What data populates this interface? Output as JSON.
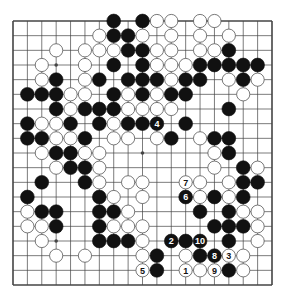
{
  "diagram": {
    "type": "go-board",
    "size": 19,
    "colors": {
      "board": "#ffffff",
      "line": "#444444",
      "black": "#111111",
      "white": "#ffffff",
      "white_outline": "#555555"
    },
    "hoshi": [
      [
        3,
        3
      ],
      [
        3,
        9
      ],
      [
        3,
        15
      ],
      [
        9,
        3
      ],
      [
        9,
        9
      ],
      [
        9,
        15
      ],
      [
        15,
        3
      ],
      [
        15,
        9
      ],
      [
        15,
        15
      ]
    ],
    "stones": {
      "black": [
        [
          0,
          7
        ],
        [
          0,
          9
        ],
        [
          1,
          7
        ],
        [
          1,
          8
        ],
        [
          2,
          8
        ],
        [
          2,
          9
        ],
        [
          2,
          15
        ],
        [
          3,
          7
        ],
        [
          3,
          9
        ],
        [
          3,
          13
        ],
        [
          3,
          14
        ],
        [
          3,
          15
        ],
        [
          3,
          16
        ],
        [
          3,
          17
        ],
        [
          4,
          3
        ],
        [
          4,
          6
        ],
        [
          4,
          8
        ],
        [
          4,
          9
        ],
        [
          4,
          10
        ],
        [
          4,
          12
        ],
        [
          4,
          13
        ],
        [
          4,
          16
        ],
        [
          5,
          1
        ],
        [
          5,
          2
        ],
        [
          5,
          3
        ],
        [
          5,
          7
        ],
        [
          5,
          9
        ],
        [
          5,
          11
        ],
        [
          5,
          12
        ],
        [
          6,
          3
        ],
        [
          6,
          5
        ],
        [
          6,
          6
        ],
        [
          6,
          7
        ],
        [
          6,
          15
        ],
        [
          7,
          1
        ],
        [
          7,
          4
        ],
        [
          7,
          6
        ],
        [
          7,
          8
        ],
        [
          7,
          9
        ],
        [
          7,
          12
        ],
        [
          8,
          1
        ],
        [
          8,
          2
        ],
        [
          8,
          5
        ],
        [
          8,
          11
        ],
        [
          8,
          14
        ],
        [
          8,
          15
        ],
        [
          9,
          3
        ],
        [
          9,
          4
        ],
        [
          9,
          15
        ],
        [
          10,
          4
        ],
        [
          10,
          5
        ],
        [
          10,
          16
        ],
        [
          11,
          2
        ],
        [
          11,
          5
        ],
        [
          11,
          16
        ],
        [
          11,
          17
        ],
        [
          12,
          1
        ],
        [
          12,
          6
        ],
        [
          12,
          14
        ],
        [
          12,
          16
        ],
        [
          13,
          2
        ],
        [
          13,
          3
        ],
        [
          13,
          6
        ],
        [
          13,
          7
        ],
        [
          13,
          13
        ],
        [
          13,
          15
        ],
        [
          14,
          3
        ],
        [
          14,
          6
        ],
        [
          14,
          14
        ],
        [
          14,
          15
        ],
        [
          14,
          16
        ],
        [
          15,
          6
        ],
        [
          15,
          7
        ],
        [
          15,
          8
        ],
        [
          15,
          12
        ],
        [
          15,
          15
        ],
        [
          16,
          10
        ],
        [
          16,
          13
        ],
        [
          17,
          10
        ],
        [
          17,
          15
        ]
      ],
      "white": [
        [
          0,
          10
        ],
        [
          0,
          11
        ],
        [
          0,
          13
        ],
        [
          0,
          14
        ],
        [
          1,
          6
        ],
        [
          1,
          9
        ],
        [
          1,
          11
        ],
        [
          1,
          13
        ],
        [
          1,
          15
        ],
        [
          2,
          3
        ],
        [
          2,
          5
        ],
        [
          2,
          6
        ],
        [
          2,
          7
        ],
        [
          2,
          10
        ],
        [
          2,
          11
        ],
        [
          2,
          13
        ],
        [
          2,
          14
        ],
        [
          3,
          2
        ],
        [
          3,
          5
        ],
        [
          3,
          10
        ],
        [
          3,
          11
        ],
        [
          3,
          12
        ],
        [
          4,
          2
        ],
        [
          4,
          5
        ],
        [
          4,
          11
        ],
        [
          4,
          15
        ],
        [
          4,
          17
        ],
        [
          5,
          4
        ],
        [
          5,
          5
        ],
        [
          5,
          8
        ],
        [
          5,
          10
        ],
        [
          5,
          16
        ],
        [
          6,
          4
        ],
        [
          6,
          8
        ],
        [
          6,
          9
        ],
        [
          6,
          10
        ],
        [
          6,
          11
        ],
        [
          7,
          2
        ],
        [
          7,
          3
        ],
        [
          7,
          7
        ],
        [
          8,
          3
        ],
        [
          8,
          4
        ],
        [
          8,
          7
        ],
        [
          8,
          8
        ],
        [
          8,
          10
        ],
        [
          8,
          13
        ],
        [
          9,
          2
        ],
        [
          9,
          5
        ],
        [
          9,
          6
        ],
        [
          9,
          14
        ],
        [
          10,
          3
        ],
        [
          10,
          6
        ],
        [
          10,
          14
        ],
        [
          10,
          17
        ],
        [
          11,
          6
        ],
        [
          11,
          8
        ],
        [
          11,
          9
        ],
        [
          11,
          13
        ],
        [
          11,
          15
        ],
        [
          12,
          7
        ],
        [
          12,
          9
        ],
        [
          12,
          13
        ],
        [
          12,
          15
        ],
        [
          13,
          1
        ],
        [
          13,
          8
        ],
        [
          13,
          16
        ],
        [
          13,
          17
        ],
        [
          14,
          1
        ],
        [
          14,
          2
        ],
        [
          14,
          7
        ],
        [
          14,
          8
        ],
        [
          14,
          9
        ],
        [
          14,
          17
        ],
        [
          15,
          2
        ],
        [
          15,
          9
        ],
        [
          15,
          17
        ],
        [
          16,
          3
        ],
        [
          16,
          5
        ],
        [
          16,
          9
        ],
        [
          16,
          12
        ],
        [
          16,
          16
        ],
        [
          17,
          13
        ],
        [
          17,
          16
        ]
      ]
    },
    "numbered_moves": [
      {
        "label": "1",
        "color": "white",
        "row": 17,
        "col": 12
      },
      {
        "label": "2",
        "color": "black",
        "row": 15,
        "col": 11
      },
      {
        "label": "3",
        "color": "white",
        "row": 16,
        "col": 15
      },
      {
        "label": "4",
        "color": "black",
        "row": 7,
        "col": 10
      },
      {
        "label": "5",
        "color": "white",
        "row": 17,
        "col": 9
      },
      {
        "label": "6",
        "color": "black",
        "row": 12,
        "col": 12
      },
      {
        "label": "7",
        "color": "white",
        "row": 11,
        "col": 12
      },
      {
        "label": "8",
        "color": "black",
        "row": 16,
        "col": 14
      },
      {
        "label": "9",
        "color": "white",
        "row": 17,
        "col": 14
      },
      {
        "label": "10",
        "color": "black",
        "row": 15,
        "col": 13
      }
    ]
  }
}
